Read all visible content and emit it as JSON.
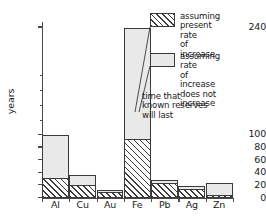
{
  "chart_data": {
    "type": "bar",
    "title": "",
    "xlabel": "",
    "ylabel": "years",
    "categories": [
      "Al",
      "Cu",
      "Au",
      "Fe",
      "Pb",
      "Ag",
      "Zn"
    ],
    "series": [
      {
        "name": "assuming present rate of increase",
        "pattern": "hatched",
        "values": [
          31,
          21,
          9,
          93,
          24,
          15,
          5
        ]
      },
      {
        "name": "assuming rate of increase does not increase",
        "pattern": "light-gray",
        "values": [
          100,
          37,
          13,
          240,
          28,
          19,
          23
        ]
      }
    ],
    "ylim": [
      0,
      250
    ],
    "ytick_labels": [
      "0",
      "20",
      "40",
      "60",
      "80",
      "100",
      "240"
    ],
    "ytick_values": [
      0,
      20,
      40,
      60,
      80,
      100,
      240
    ],
    "yaxis_broken": true,
    "grid": false,
    "legend_position": "top-right",
    "annotations": [
      "time that known reserves will last"
    ]
  },
  "axis": {
    "y_title": "years",
    "ticks": [
      {
        "label": "240",
        "value": 240
      },
      {
        "label": "100",
        "value": 100
      },
      {
        "label": "80",
        "value": 80
      },
      {
        "label": "60",
        "value": 60
      },
      {
        "label": "40",
        "value": 40
      },
      {
        "label": "20",
        "value": 20
      },
      {
        "label": "0",
        "value": 0
      }
    ]
  },
  "legend": {
    "items": [
      {
        "swatch": "hatched",
        "label": "assuming\npresent rate\nof increase"
      },
      {
        "swatch": "light-gray",
        "label": "assuming rate\nof increase\ndoes not increase"
      }
    ]
  },
  "annotation": {
    "text": "time that\nknown reserves\nwill last"
  }
}
